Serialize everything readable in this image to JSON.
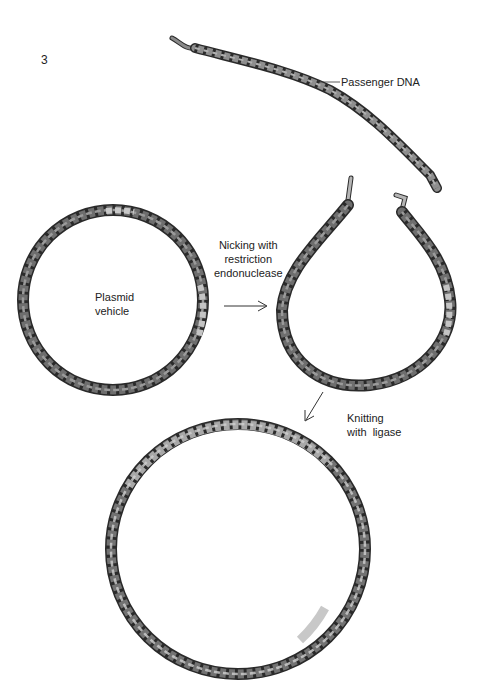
{
  "figure": {
    "number": "3",
    "labels": {
      "passenger_dna": "Passenger DNA",
      "plasmid_line1": "Plasmid",
      "plasmid_line2": "vehicle",
      "nicking_line1": "Nicking with",
      "nicking_line2": "restriction",
      "nicking_line3": "endonuclease",
      "knitting_line1": "Knitting",
      "knitting_line2": "with  ligase"
    },
    "colors": {
      "vehicle_strand": "#6e6e6e",
      "passenger_strand": "#b5b5b5",
      "outline": "#2a2a2a",
      "background": "#ffffff"
    },
    "steps": [
      {
        "id": "passenger",
        "description": "Linear passenger DNA helix"
      },
      {
        "id": "plasmid",
        "description": "Circular plasmid vehicle"
      },
      {
        "id": "nicked",
        "description": "Opened plasmid after restriction cut"
      },
      {
        "id": "recombinant",
        "description": "Recombinant circle joined by ligase"
      }
    ]
  }
}
